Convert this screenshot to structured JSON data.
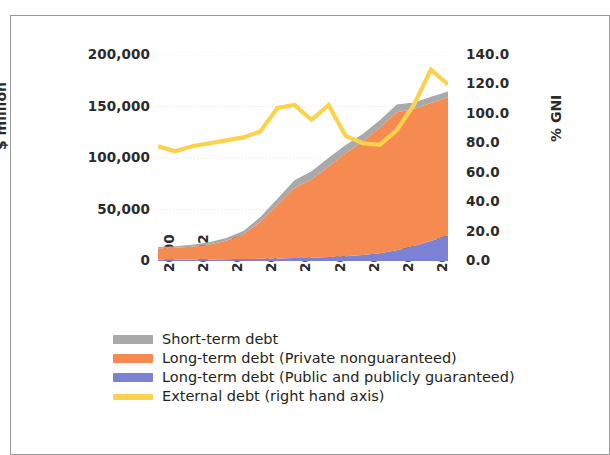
{
  "page": {
    "cropped_header_text": "",
    "background": "#ffffff",
    "frame_color": "#9a9a9a"
  },
  "chart_data": {
    "type": "area",
    "title": "",
    "subtitle": "",
    "xlabel": "",
    "ylabel": "$ million",
    "y2label": "% GNI",
    "grid": true,
    "legend_position": "bottom-left",
    "x": [
      2000,
      2001,
      2002,
      2003,
      2004,
      2005,
      2006,
      2007,
      2008,
      2009,
      2010,
      2011,
      2012,
      2013,
      2014,
      2015,
      2016,
      2017
    ],
    "xtick_labels": [
      "2000",
      "2002",
      "2004",
      "2006",
      "2008",
      "2010",
      "2012",
      "2014",
      "2016"
    ],
    "xticks": [
      2000,
      2002,
      2004,
      2006,
      2008,
      2010,
      2012,
      2014,
      2016
    ],
    "xlim": [
      2000,
      2017
    ],
    "ylim": [
      0,
      200000
    ],
    "yticks": [
      0,
      50000,
      100000,
      150000,
      200000
    ],
    "ytick_labels": [
      "0",
      "50,000",
      "100,000",
      "150,000",
      "200,000"
    ],
    "y2lim": [
      0,
      140
    ],
    "y2ticks": [
      0,
      20,
      40,
      60,
      80,
      100,
      120,
      140
    ],
    "y2tick_labels": [
      "0.0",
      "20.0",
      "40.0",
      "60.0",
      "80.0",
      "100.0",
      "120.0",
      "140.0"
    ],
    "stacked": true,
    "stack_order": [
      "Long-term debt (Public and publicly guaranteed)",
      "Long-term debt (Private nonguaranteed)",
      "Short-term debt"
    ],
    "series": [
      {
        "name": "Long-term debt (Public and publicly guaranteed)",
        "type": "area",
        "axis": "left",
        "color": "#7b82d4",
        "values": [
          1200,
          1300,
          1400,
          1500,
          1700,
          1900,
          2100,
          2400,
          2800,
          3200,
          3800,
          4600,
          5800,
          7600,
          10500,
          14500,
          19500,
          25000
        ]
      },
      {
        "name": "Long-term debt (Private nonguaranteed)",
        "type": "area",
        "axis": "left",
        "color": "#f68b51",
        "values": [
          11000,
          11500,
          12500,
          14500,
          18000,
          24000,
          36000,
          52000,
          68000,
          76000,
          88000,
          100000,
          110000,
          122000,
          134000,
          133000,
          134000,
          134000
        ]
      },
      {
        "name": "Short-term debt",
        "type": "area",
        "axis": "left",
        "color": "#a9a9a9",
        "values": [
          1500,
          1600,
          1800,
          2100,
          2600,
          3200,
          4500,
          6000,
          7500,
          8000,
          8500,
          8000,
          7500,
          7000,
          7500,
          6500,
          6000,
          5500
        ]
      },
      {
        "name": "External debt (right hand axis)",
        "type": "line",
        "axis": "right",
        "color": "#fcd24c",
        "values": [
          78.0,
          74.5,
          78.0,
          80.0,
          82.0,
          84.0,
          88.0,
          104.0,
          106.0,
          96.0,
          106.0,
          85.0,
          80.0,
          79.0,
          89.0,
          106.0,
          130.0,
          120.0
        ]
      }
    ]
  },
  "axes": {
    "left_title": "$ million",
    "right_title": "% GNI"
  },
  "legend": {
    "items": [
      {
        "label": "Short-term debt",
        "color": "#a9a9a9",
        "style": "block"
      },
      {
        "label": "Long-term debt (Private nonguaranteed)",
        "color": "#f68b51",
        "style": "block"
      },
      {
        "label": "Long-term debt (Public and publicly guaranteed)",
        "color": "#7b82d4",
        "style": "block"
      },
      {
        "label": "External debt (right hand axis)",
        "color": "#fcd24c",
        "style": "line"
      }
    ]
  }
}
